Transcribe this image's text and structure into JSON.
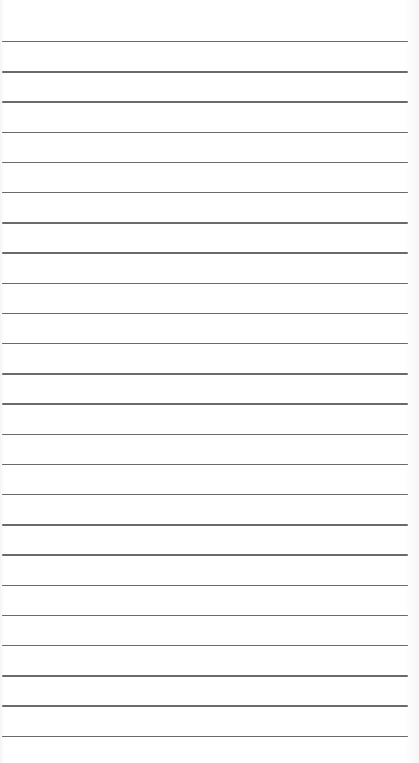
{
  "paper": {
    "background_color": "#fdfdfd",
    "line_color": "#6a6a6a",
    "line_count": 24,
    "first_line_y": 41,
    "line_spacing": 30.2
  }
}
